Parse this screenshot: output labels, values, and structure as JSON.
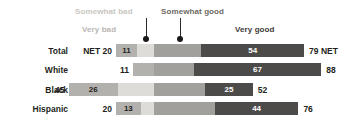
{
  "chart_data": {
    "type": "bar",
    "subtype": "stacked-horizontal-diverging",
    "title": "",
    "xlabel": "",
    "ylabel": "",
    "xlim": [
      0,
      100
    ],
    "grid": false,
    "legend_position": "top-inline-annotations",
    "categories": [
      "Total",
      "White",
      "Black",
      "Hispanic"
    ],
    "series": [
      {
        "name": "Very bad",
        "values": [
          11,
          11,
          26,
          13
        ]
      },
      {
        "name": "Somewhat bad",
        "values": [
          9,
          0,
          19,
          7
        ]
      },
      {
        "name": "Somewhat good",
        "values": [
          25,
          21,
          27,
          32
        ]
      },
      {
        "name": "Very good",
        "values": [
          54,
          67,
          25,
          44
        ]
      }
    ],
    "net_left": [
      20,
      0,
      45,
      20
    ],
    "net_right": [
      79,
      88,
      52,
      76
    ],
    "colors": {
      "very_bad": "#b3b1ad",
      "somewhat_bad": "#dedcd8",
      "somewhat_good": "#a2a09c",
      "very_good": "#4d4b49",
      "text": "#231f20",
      "leader": "#1a1918"
    }
  },
  "annotations": {
    "somewhat_bad_label": "Somewhat bad",
    "very_bad_label": "Very bad",
    "somewhat_good_label": "Somewhat good",
    "very_good_label": "Very good"
  },
  "rows": [
    {
      "label": "Total",
      "net_left_text": "NET 20",
      "net_right_text": "79 NET",
      "segments": [
        {
          "name": "very-bad",
          "value_text": "11",
          "show": true
        },
        {
          "name": "somewhat-bad",
          "value_text": "",
          "show": false
        },
        {
          "name": "somewhat-good",
          "value_text": "",
          "show": false
        },
        {
          "name": "very-good",
          "value_text": "54",
          "show": true
        }
      ]
    },
    {
      "label": "White",
      "net_left_text": "11",
      "net_right_text": "88",
      "segments": [
        {
          "name": "very-bad",
          "value_text": "",
          "show": false
        },
        {
          "name": "somewhat-bad",
          "value_text": "",
          "show": false
        },
        {
          "name": "somewhat-good",
          "value_text": "",
          "show": false
        },
        {
          "name": "very-good",
          "value_text": "67",
          "show": true
        }
      ]
    },
    {
      "label": "Black",
      "net_left_text": "45",
      "net_right_text": "52",
      "segments": [
        {
          "name": "very-bad",
          "value_text": "26",
          "show": true
        },
        {
          "name": "somewhat-bad",
          "value_text": "",
          "show": false
        },
        {
          "name": "somewhat-good",
          "value_text": "",
          "show": false
        },
        {
          "name": "very-good",
          "value_text": "25",
          "show": true
        }
      ]
    },
    {
      "label": "Hispanic",
      "net_left_text": "20",
      "net_right_text": "76",
      "segments": [
        {
          "name": "very-bad",
          "value_text": "13",
          "show": true
        },
        {
          "name": "somewhat-bad",
          "value_text": "",
          "show": false
        },
        {
          "name": "somewhat-good",
          "value_text": "",
          "show": false
        },
        {
          "name": "very-good",
          "value_text": "44",
          "show": true
        }
      ]
    }
  ]
}
